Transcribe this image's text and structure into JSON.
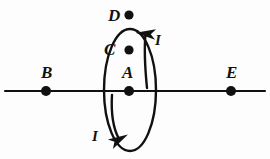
{
  "figure": {
    "background_color": "#fdfdfd",
    "ink_color": "#111111",
    "width": 270,
    "height": 159
  },
  "axis": {
    "name": "horizontal-axis-line",
    "x1": 5,
    "y1": 91,
    "x2": 265,
    "y2": 91,
    "stroke_width": 2.2
  },
  "loop": {
    "name": "current-loop-ellipse",
    "cx": 130,
    "cy": 90,
    "rx": 26,
    "ry": 61,
    "stroke_width": 2.4
  },
  "points": [
    {
      "id": "D",
      "label": "D",
      "dot_x": 129,
      "dot_y": 15,
      "dot_r": 4.6,
      "label_x": 108,
      "label_y": 7
    },
    {
      "id": "C",
      "label": "C",
      "dot_x": 129,
      "dot_y": 50,
      "dot_r": 4.6,
      "label_x": 104,
      "label_y": 41
    },
    {
      "id": "A",
      "label": "A",
      "dot_x": 129,
      "dot_y": 91,
      "dot_r": 5.0,
      "label_x": 122,
      "label_y": 64
    },
    {
      "id": "B",
      "label": "B",
      "dot_x": 46,
      "dot_y": 91,
      "dot_r": 5.0,
      "label_x": 41,
      "label_y": 64
    },
    {
      "id": "E",
      "label": "E",
      "dot_x": 231,
      "dot_y": 91,
      "dot_r": 5.0,
      "label_x": 226,
      "label_y": 64
    }
  ],
  "current_arrows": [
    {
      "id": "current-up-right",
      "label": "I",
      "direction": "up",
      "path": "M 147 88 C 145 68, 144 50, 145.5 34",
      "label_x": 155,
      "label_y": 33,
      "stroke_width": 2.4
    },
    {
      "id": "current-down-left",
      "label": "I",
      "direction": "down",
      "path": "M 112 95 C 111 112, 113 128, 119 139",
      "label_x": 92,
      "label_y": 129,
      "stroke_width": 2.4
    }
  ],
  "legend": {
    "current_symbol": "I",
    "current_meaning": "current direction along loop"
  }
}
